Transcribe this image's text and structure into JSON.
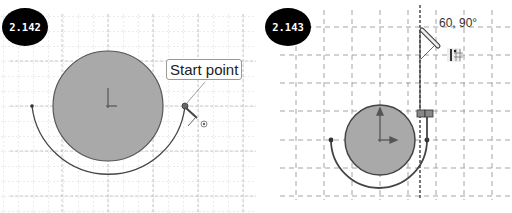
{
  "panels": [
    {
      "id": "left",
      "badge": "2.142",
      "tooltip": "Start point",
      "icons": [
        "pencil-cursor-icon",
        "concentric-snap-icon"
      ]
    },
    {
      "id": "right",
      "badge": "2.143",
      "angle_label": "60, 90°",
      "icons": [
        "pencil-cursor-icon",
        "vertical-relation-icon",
        "grid-snap-icon"
      ]
    }
  ],
  "colors": {
    "badge_bg": "#000000",
    "circle_fill": "#a8a8a8",
    "stroke": "#555555",
    "grid": "#c8c8c8",
    "background": "#ffffff"
  }
}
